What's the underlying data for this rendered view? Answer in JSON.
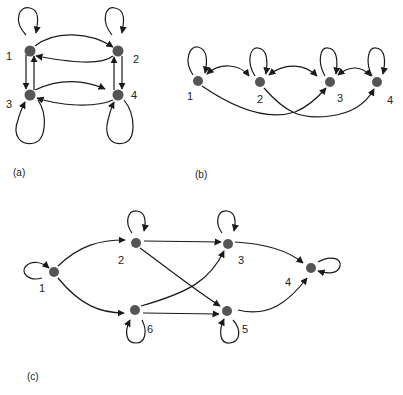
{
  "colors": {
    "node": "#555555",
    "edge": "#1a1a1a",
    "background": "#ffffff"
  },
  "diagrams": [
    {
      "id": "a",
      "caption": "(a)",
      "nodes": [
        {
          "label": "1"
        },
        {
          "label": "2"
        },
        {
          "label": "3"
        },
        {
          "label": "4"
        }
      ],
      "edges": [
        "1->1",
        "2->2",
        "3->3",
        "4->4",
        "1->2",
        "2->1",
        "1->3",
        "3->1",
        "2->4",
        "4->2",
        "3->4",
        "4->3"
      ]
    },
    {
      "id": "b",
      "caption": "(b)",
      "nodes": [
        {
          "label": "1"
        },
        {
          "label": "2"
        },
        {
          "label": "3"
        },
        {
          "label": "4"
        }
      ],
      "edges": [
        "1->1",
        "2->2",
        "3->3",
        "4->4",
        "1<->2",
        "2<->3",
        "3<->4",
        "1->3",
        "2->4"
      ]
    },
    {
      "id": "c",
      "caption": "(c)",
      "nodes": [
        {
          "label": "1"
        },
        {
          "label": "2"
        },
        {
          "label": "3"
        },
        {
          "label": "4"
        },
        {
          "label": "5"
        },
        {
          "label": "6"
        }
      ],
      "edges": [
        "1->1",
        "2->2",
        "3->3",
        "4->4",
        "5->5",
        "6->6",
        "1->2",
        "1->6",
        "2->3",
        "2->5",
        "6->3",
        "6->5",
        "3->4",
        "5->4"
      ]
    }
  ]
}
